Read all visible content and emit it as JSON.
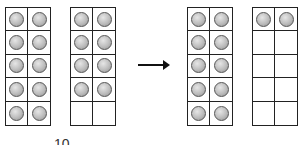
{
  "before": {
    "frames": [
      {
        "filled": 10,
        "total": 10
      },
      {
        "filled": 8,
        "total": 10
      }
    ],
    "label": "10"
  },
  "arrow": "right-arrow",
  "after": {
    "frames": [
      {
        "filled": 10,
        "total": 10
      },
      {
        "filled": 2,
        "total": 10
      }
    ]
  },
  "colors": {
    "counter": "#b0b0b0",
    "border": "#222222"
  }
}
